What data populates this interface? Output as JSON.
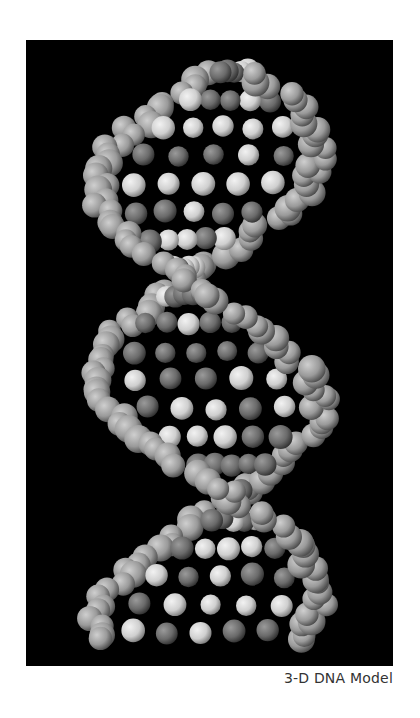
{
  "figure": {
    "caption": "3-D DNA Model",
    "background": "#000000",
    "atom_colors": {
      "dark": "#6e6e6e",
      "mid": "#9a9a9a",
      "light": "#d4d4d4"
    }
  }
}
